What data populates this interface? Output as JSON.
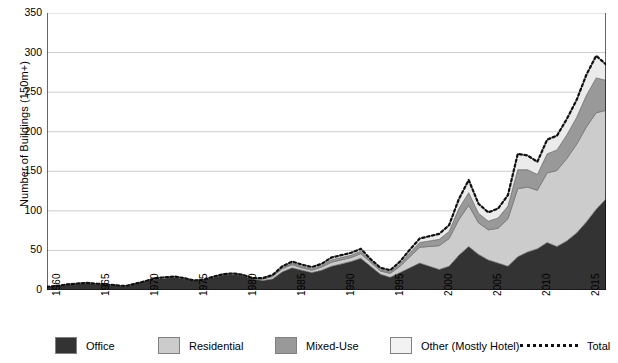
{
  "chart_data": {
    "type": "area",
    "stacked": true,
    "title": "",
    "xlabel": "",
    "ylabel": "Number of Buildings (150m+)",
    "ylim": [
      0,
      350
    ],
    "ytick_values": [
      0,
      50,
      100,
      150,
      200,
      250,
      300,
      350
    ],
    "xlim": [
      1960,
      2017
    ],
    "xtick_labels": [
      "1960",
      "1965",
      "1970",
      "1975",
      "1980",
      "1985",
      "1990",
      "1995",
      "2000",
      "2005",
      "2010",
      "2015"
    ],
    "xtick_values": [
      1960,
      1965,
      1970,
      1975,
      1980,
      1985,
      1990,
      1995,
      2000,
      2005,
      2010,
      2015
    ],
    "grid": true,
    "grid_axis": "y",
    "legend_position": "bottom",
    "x": [
      1960,
      1961,
      1962,
      1963,
      1964,
      1965,
      1966,
      1967,
      1968,
      1969,
      1970,
      1971,
      1972,
      1973,
      1974,
      1975,
      1976,
      1977,
      1978,
      1979,
      1980,
      1981,
      1982,
      1983,
      1984,
      1985,
      1986,
      1987,
      1988,
      1989,
      1990,
      1991,
      1992,
      1993,
      1994,
      1995,
      1996,
      1997,
      1998,
      1999,
      2000,
      2001,
      2002,
      2003,
      2004,
      2005,
      2006,
      2007,
      2008,
      2009,
      2010,
      2011,
      2012,
      2013,
      2014,
      2015,
      2016,
      2017
    ],
    "series": [
      {
        "name": "Office",
        "color": "#333333",
        "values": [
          4,
          5,
          7,
          8,
          9,
          8,
          7,
          6,
          5,
          8,
          11,
          14,
          15,
          16,
          14,
          12,
          13,
          16,
          19,
          20,
          18,
          14,
          12,
          14,
          23,
          28,
          25,
          22,
          25,
          30,
          33,
          36,
          40,
          30,
          20,
          16,
          22,
          28,
          34,
          30,
          26,
          30,
          44,
          55,
          45,
          38,
          34,
          30,
          42,
          48,
          52,
          60,
          55,
          62,
          72,
          86,
          102,
          115
        ]
      },
      {
        "name": "Residential",
        "color": "#cccccc",
        "values": [
          0,
          0,
          0,
          0,
          0,
          0,
          0,
          0,
          0,
          0,
          0,
          1,
          1,
          1,
          1,
          0,
          0,
          1,
          1,
          1,
          1,
          1,
          2,
          3,
          4,
          4,
          3,
          3,
          4,
          5,
          5,
          5,
          6,
          5,
          4,
          5,
          8,
          14,
          20,
          25,
          30,
          35,
          45,
          52,
          40,
          38,
          44,
          60,
          86,
          82,
          74,
          88,
          96,
          104,
          112,
          120,
          122,
          112
        ]
      },
      {
        "name": "Mixed-Use",
        "color": "#999999",
        "values": [
          0,
          0,
          0,
          0,
          0,
          0,
          0,
          0,
          0,
          0,
          0,
          0,
          0,
          0,
          0,
          0,
          0,
          0,
          0,
          0,
          0,
          0,
          0,
          1,
          1,
          2,
          2,
          2,
          2,
          3,
          3,
          3,
          3,
          2,
          2,
          2,
          3,
          5,
          6,
          7,
          8,
          9,
          14,
          16,
          12,
          11,
          13,
          16,
          24,
          22,
          20,
          24,
          26,
          30,
          34,
          40,
          44,
          38
        ]
      },
      {
        "name": "Other (Mostly Hotel)",
        "color": "#ebebeb",
        "values": [
          0,
          0,
          0,
          0,
          0,
          0,
          0,
          0,
          0,
          0,
          0,
          0,
          0,
          0,
          0,
          0,
          0,
          0,
          0,
          0,
          0,
          0,
          1,
          1,
          2,
          2,
          2,
          2,
          2,
          3,
          3,
          3,
          3,
          2,
          2,
          2,
          3,
          4,
          5,
          6,
          7,
          8,
          12,
          16,
          12,
          11,
          12,
          14,
          20,
          18,
          16,
          18,
          18,
          20,
          22,
          26,
          28,
          20
        ]
      }
    ],
    "total_line": {
      "name": "Total",
      "style": "dotted",
      "color": "#111111",
      "values": [
        4,
        5,
        7,
        8,
        9,
        8,
        7,
        6,
        5,
        8,
        11,
        15,
        16,
        17,
        15,
        12,
        13,
        17,
        20,
        21,
        19,
        15,
        15,
        19,
        30,
        36,
        32,
        29,
        33,
        41,
        44,
        47,
        52,
        39,
        28,
        25,
        36,
        51,
        65,
        68,
        71,
        82,
        115,
        139,
        109,
        98,
        103,
        120,
        172,
        170,
        162,
        190,
        195,
        216,
        240,
        272,
        296,
        285
      ]
    }
  },
  "legend": {
    "items": [
      {
        "label": "Office",
        "color": "#333333",
        "type": "swatch"
      },
      {
        "label": "Residential",
        "color": "#cccccc",
        "type": "swatch"
      },
      {
        "label": "Mixed-Use",
        "color": "#999999",
        "type": "swatch"
      },
      {
        "label": "Other (Mostly Hotel)",
        "color": "#f2f2f2",
        "type": "swatch"
      },
      {
        "label": "Total",
        "color": "#111111",
        "type": "dotted-line"
      }
    ]
  }
}
